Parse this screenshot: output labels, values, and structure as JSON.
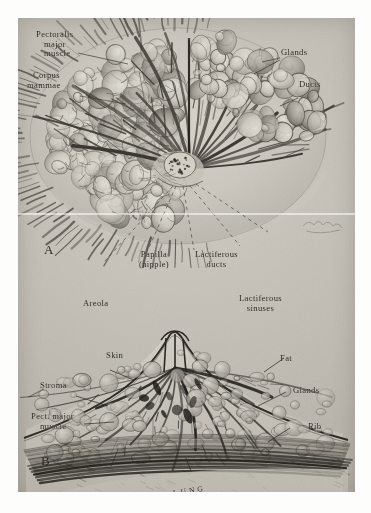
{
  "plate": {
    "title": "Anatomy of the female breast",
    "caption_a": "A",
    "caption_b": "B",
    "signature": "V. Clark",
    "lung_label": "LUNG",
    "background_color": "#c6c2b9",
    "ink_color": "#2e2b26"
  },
  "figure_a": {
    "name": "Dissection of breast, anterior view",
    "labels": [
      {
        "id": "pectoralis",
        "text": "Pectoralis\nmajor\nmuscle",
        "lines": [
          "Pectoralis",
          "major",
          "muscle"
        ]
      },
      {
        "id": "corpus",
        "text": "Corpus\nmammae",
        "lines": [
          "Corpus",
          "mammae"
        ]
      },
      {
        "id": "glands",
        "text": "Glands",
        "lines": [
          "Glands"
        ]
      },
      {
        "id": "ducts",
        "text": "Ducts",
        "lines": [
          "Ducts"
        ]
      },
      {
        "id": "papilla",
        "text": "Papilla\n(nipple)",
        "lines": [
          "Papilla",
          "(nipple)"
        ]
      },
      {
        "id": "lactiferous_ducts",
        "text": "Lactiferous\nducts",
        "lines": [
          "Lactiferous",
          "ducts"
        ]
      },
      {
        "id": "lactiferous_sinuses",
        "text": "Lactiferous\nsinuses",
        "lines": [
          "Lactiferous",
          "sinuses"
        ]
      },
      {
        "id": "areola",
        "text": "Areola",
        "lines": [
          "Areola"
        ]
      }
    ]
  },
  "figure_b": {
    "name": "Sagittal section of breast",
    "labels": [
      {
        "id": "skin",
        "text": "Skin",
        "lines": [
          "Skin"
        ]
      },
      {
        "id": "stroma",
        "text": "Stroma",
        "lines": [
          "Stroma"
        ]
      },
      {
        "id": "pect_major",
        "text": "Pect. major\nmuscle",
        "lines": [
          "Pect. major",
          "muscle"
        ]
      },
      {
        "id": "fat",
        "text": "Fat",
        "lines": [
          "Fat"
        ]
      },
      {
        "id": "glands_b",
        "text": "Glands",
        "lines": [
          "Glands"
        ]
      },
      {
        "id": "rib",
        "text": "Rib",
        "lines": [
          "Rib"
        ]
      },
      {
        "id": "lung",
        "text": "LUNG",
        "lines": [
          "LUNG"
        ]
      }
    ]
  },
  "text": {
    "pectoralis_l1": "Pectoralis",
    "pectoralis_l2": "major",
    "pectoralis_l3": "muscle",
    "corpus_l1": "Corpus",
    "corpus_l2": "mammae",
    "glands": "Glands",
    "ducts": "Ducts",
    "papilla_l1": "Papilla",
    "papilla_l2": "(nipple)",
    "lact_ducts_l1": "Lactiferous",
    "lact_ducts_l2": "ducts",
    "lact_sin_l1": "Lactiferous",
    "lact_sin_l2": "sinuses",
    "areola": "Areola",
    "skin": "Skin",
    "stroma": "Stroma",
    "pectb_l1": "Pect. major",
    "pectb_l2": "muscle",
    "fat": "Fat",
    "glands_b": "Glands",
    "rib": "Rib",
    "marker_a": "A",
    "marker_b": "B",
    "lung": "LUNG",
    "signature": "V. Clark"
  }
}
